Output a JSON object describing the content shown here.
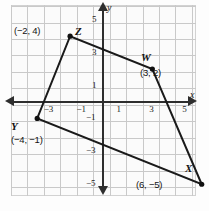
{
  "figure": {
    "type": "coordinate-plane-quadrilateral",
    "axis_labels": {
      "x": "x",
      "y": "y"
    },
    "x_ticks": [
      {
        "value": -3,
        "label": "−3"
      },
      {
        "value": -1,
        "label": "−1"
      },
      {
        "value": 1,
        "label": "1"
      },
      {
        "value": 3,
        "label": "3"
      },
      {
        "value": 5,
        "label": "5"
      }
    ],
    "y_ticks": [
      {
        "value": 5,
        "label": "5"
      },
      {
        "value": 3,
        "label": "3"
      },
      {
        "value": 1,
        "label": "1"
      },
      {
        "value": -1,
        "label": "−1"
      },
      {
        "value": -3,
        "label": "−3"
      },
      {
        "value": -5,
        "label": "−5"
      }
    ],
    "vertices": [
      {
        "name": "W",
        "x": 3,
        "y": 2,
        "coord_label": "(3, 2)"
      },
      {
        "name": "X",
        "x": 6,
        "y": -5,
        "coord_label": "(6, −5)"
      },
      {
        "name": "Y",
        "x": -4,
        "y": -1,
        "coord_label": "(−4, −1)"
      },
      {
        "name": "Z",
        "x": -2,
        "y": 4,
        "coord_label": "(−2, 4)"
      }
    ]
  },
  "chart_data": {
    "type": "scatter",
    "title": "",
    "xlabel": "x",
    "ylabel": "y",
    "xlim": [
      -5.6,
      5.6
    ],
    "ylim": [
      -5.9,
      5.9
    ],
    "grid": true,
    "legend": "none",
    "series": [
      {
        "name": "Quadrilateral WXYZ",
        "closed": true,
        "points": [
          {
            "label": "W",
            "x": 3,
            "y": 2
          },
          {
            "label": "X",
            "x": 6,
            "y": -5
          },
          {
            "label": "Y",
            "x": -4,
            "y": -1
          },
          {
            "label": "Z",
            "x": -2,
            "y": 4
          }
        ]
      }
    ],
    "annotations": [
      {
        "text": "(−2, 4)",
        "x": -2,
        "y": 4
      },
      {
        "text": "(3, 2)",
        "x": 3,
        "y": 2
      },
      {
        "text": "(−4, −1)",
        "x": -4,
        "y": -1
      },
      {
        "text": "(6, −5)",
        "x": 6,
        "y": -5
      }
    ]
  },
  "colors": {
    "grid": "#c9c9c9",
    "axis": "#2e2e2e",
    "polygon": "#1a1a1a",
    "point": "#111111",
    "background": "#fdfdfd"
  }
}
